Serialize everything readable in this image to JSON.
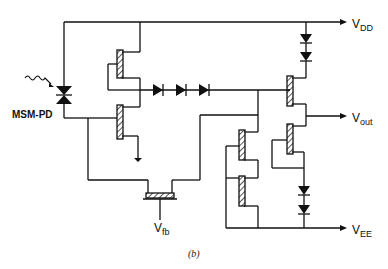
{
  "diagram": {
    "caption": "(b)",
    "labels": {
      "vdd_main": "V",
      "vdd_sub": "DD",
      "vout_main": "V",
      "vout_sub": "out",
      "vee_main": "V",
      "vee_sub": "EE",
      "vfb_main": "V",
      "vfb_sub": "fb",
      "photodiode": "MSM-PD"
    },
    "components": {
      "level_shift_diodes": 3,
      "vdd_diodes": 2,
      "vee_diodes": 2,
      "transistors": 7
    },
    "colors": {
      "line": "#111111",
      "background": "#ffffff"
    }
  }
}
